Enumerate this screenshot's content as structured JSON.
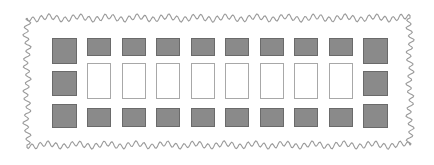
{
  "diagram": {
    "colors": {
      "background": "#ffffff",
      "filled_cell": "#8a8a8a",
      "filled_cell_border": "#6a6a6a",
      "empty_cell_border": "#a8a8a8",
      "wavy_border": "#9a9a9a"
    },
    "layout": {
      "rows": 3,
      "columns": 10,
      "corner_columns": "first and last columns are larger squares",
      "inner_columns": 8
    },
    "rows": [
      {
        "name": "top-row",
        "cells": [
          "filled-large",
          "filled",
          "filled",
          "filled",
          "filled",
          "filled",
          "filled",
          "filled",
          "filled",
          "filled-large"
        ]
      },
      {
        "name": "middle-row",
        "cells": [
          "filled-large",
          "empty",
          "empty",
          "empty",
          "empty",
          "empty",
          "empty",
          "empty",
          "empty",
          "filled-large"
        ]
      },
      {
        "name": "bottom-row",
        "cells": [
          "filled-large",
          "filled",
          "filled",
          "filled",
          "filled",
          "filled",
          "filled",
          "filled",
          "filled",
          "filled-large"
        ]
      }
    ]
  }
}
